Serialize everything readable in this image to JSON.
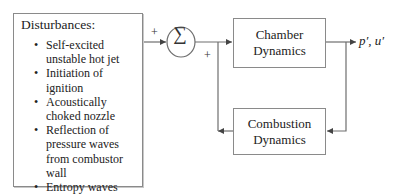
{
  "disturbances": {
    "title": "Disturbances:",
    "items": [
      "Self-excited unstable hot jet",
      "Initiation of ignition",
      "Acoustically choked nozzle",
      "Reflection of pressure waves from combustor wall",
      "Entropy waves"
    ]
  },
  "summing_junction": {
    "symbol": "∑",
    "input_signs": [
      "+",
      "+"
    ]
  },
  "blocks": {
    "chamber": {
      "line1": "Chamber",
      "line2": "Dynamics"
    },
    "combustion": {
      "line1": "Combustion",
      "line2": "Dynamics"
    }
  },
  "output": {
    "label": "p′, u′"
  },
  "colors": {
    "line": "#6e6e6e",
    "box_border": "#8a8a8a",
    "text": "#222222"
  }
}
